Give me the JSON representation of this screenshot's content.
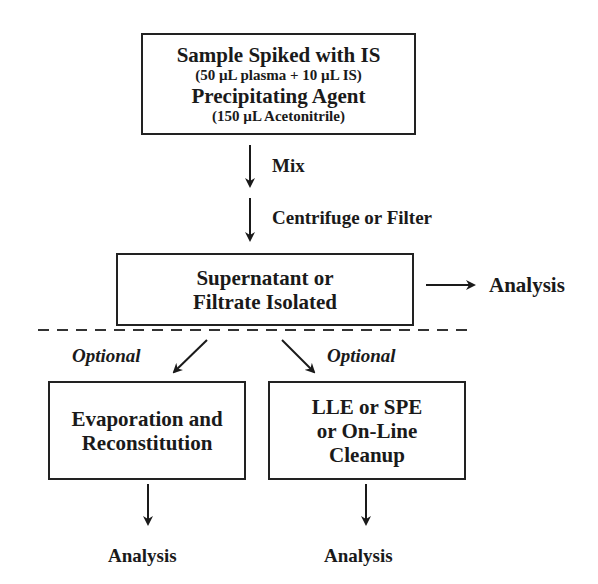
{
  "top_box": {
    "line1": "Sample Spiked with IS",
    "line2": "(50 µL plasma + 10 µL IS)",
    "line3": "Precipitating Agent",
    "line4": "(150 µL Acetonitrile)"
  },
  "steps": {
    "mix": "Mix",
    "centrifuge": "Centrifuge or Filter"
  },
  "middle_box": {
    "line1": "Supernatant or",
    "line2": "Filtrate Isolated"
  },
  "side_analysis": "Analysis",
  "branches": {
    "left_optional": "Optional",
    "right_optional": "Optional"
  },
  "left_box": {
    "line1": "Evaporation and",
    "line2": "Reconstitution"
  },
  "right_box": {
    "line1": "LLE or SPE",
    "line2": "or On-Line",
    "line3": "Cleanup"
  },
  "left_analysis": "Analysis",
  "right_analysis": "Analysis"
}
